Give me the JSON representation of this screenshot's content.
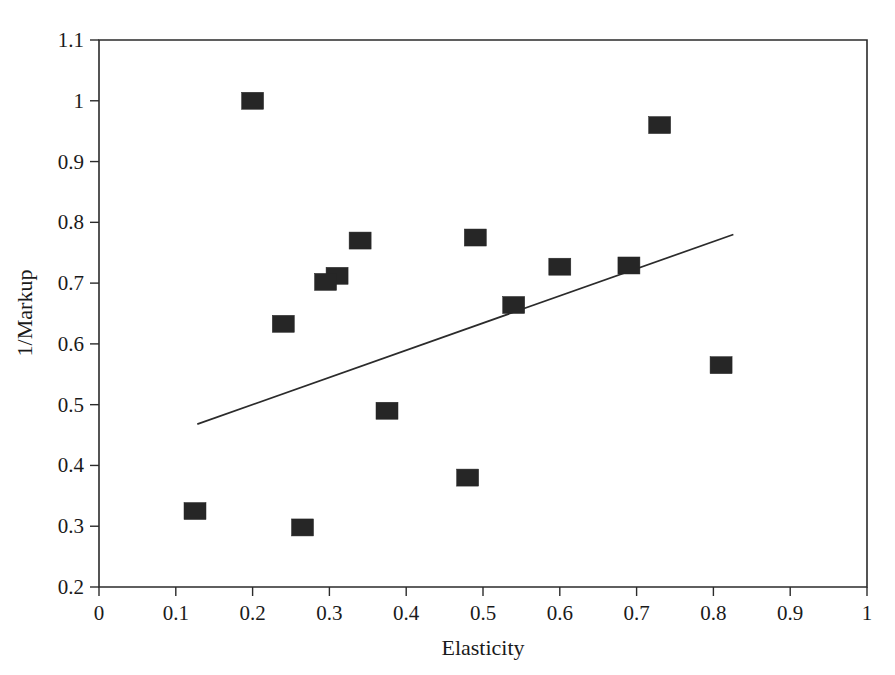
{
  "chart_data": {
    "type": "scatter",
    "title": "",
    "xlabel": "Elasticity",
    "ylabel": "1/Markup",
    "xlim": [
      0,
      1
    ],
    "ylim": [
      0.2,
      1.1
    ],
    "grid": false,
    "legend": null,
    "xticks": [
      "0",
      "0.1",
      "0.2",
      "0.3",
      "0.4",
      "0.5",
      "0.6",
      "0.7",
      "0.8",
      "0.9",
      "1"
    ],
    "xtick_values": [
      0,
      0.1,
      0.2,
      0.3,
      0.4,
      0.5,
      0.6,
      0.7,
      0.8,
      0.9,
      1
    ],
    "yticks": [
      "0.2",
      "0.3",
      "0.4",
      "0.5",
      "0.6",
      "0.7",
      "0.8",
      "0.9",
      "1",
      "1.1"
    ],
    "ytick_values": [
      0.2,
      0.3,
      0.4,
      0.5,
      0.6,
      0.7,
      0.8,
      0.9,
      1.0,
      1.1
    ],
    "marker_style": "filled-square",
    "marker_color": "#262626",
    "points": [
      {
        "x": 0.2,
        "y": 1.0
      },
      {
        "x": 0.73,
        "y": 0.96
      },
      {
        "x": 0.34,
        "y": 0.77
      },
      {
        "x": 0.49,
        "y": 0.775
      },
      {
        "x": 0.6,
        "y": 0.727
      },
      {
        "x": 0.69,
        "y": 0.729
      },
      {
        "x": 0.31,
        "y": 0.712
      },
      {
        "x": 0.295,
        "y": 0.702
      },
      {
        "x": 0.54,
        "y": 0.664
      },
      {
        "x": 0.24,
        "y": 0.633
      },
      {
        "x": 0.81,
        "y": 0.565
      },
      {
        "x": 0.375,
        "y": 0.49
      },
      {
        "x": 0.48,
        "y": 0.38
      },
      {
        "x": 0.125,
        "y": 0.325
      },
      {
        "x": 0.265,
        "y": 0.298
      }
    ],
    "trend_line": {
      "type": "linear-fit",
      "x_start": 0.128,
      "y_start": 0.468,
      "x_end": 0.826,
      "y_end": 0.78,
      "color": "#2b2b2b"
    }
  }
}
